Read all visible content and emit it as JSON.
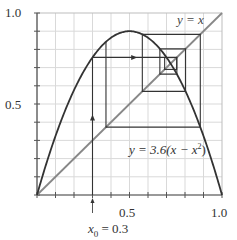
{
  "chart_data": {
    "type": "line",
    "title": "",
    "xlabel": "",
    "ylabel": "",
    "xlim": [
      0,
      1
    ],
    "ylim": [
      0,
      1
    ],
    "grid": true,
    "grid_step": 0.1,
    "x_ticks": [
      "0.5",
      "1.0"
    ],
    "y_ticks": [
      "0.5",
      "1.0"
    ],
    "series": [
      {
        "name": "y = 3.6(x − x²)",
        "kind": "curve",
        "r": 3.6,
        "color": "#333333"
      },
      {
        "name": "y = x",
        "kind": "line",
        "x": [
          0,
          1
        ],
        "y": [
          0,
          1
        ],
        "color": "#888888"
      },
      {
        "name": "cobweb",
        "kind": "iteration",
        "x0": 0.3,
        "color": "#333333",
        "points": [
          [
            0.3,
            0.0
          ],
          [
            0.3,
            0.756
          ],
          [
            0.756,
            0.756
          ],
          [
            0.756,
            0.6641
          ],
          [
            0.6641,
            0.6641
          ],
          [
            0.6641,
            0.8031
          ],
          [
            0.8031,
            0.8031
          ],
          [
            0.8031,
            0.5693
          ],
          [
            0.5693,
            0.5693
          ],
          [
            0.5693,
            0.8827
          ],
          [
            0.8827,
            0.8827
          ],
          [
            0.8827,
            0.3728
          ],
          [
            0.3728,
            0.3728
          ],
          [
            0.3728,
            0.8417
          ]
        ]
      },
      {
        "name": "fixed-point box",
        "kind": "box",
        "x": [
          0.69,
          0.755
        ],
        "y": [
          0.69,
          0.755
        ],
        "color": "#333333"
      }
    ],
    "annotations": [
      {
        "text": "y = x",
        "x": 0.82,
        "y": 0.93
      },
      {
        "text": "y = 3.6(x − x²)",
        "x": 0.62,
        "y": 0.33
      },
      {
        "text": "x₀ = 0.3",
        "x": 0.3,
        "y": -0.12
      }
    ]
  },
  "labels": {
    "y_top": "1.0",
    "y_mid": "0.5",
    "x_mid": "0.5",
    "x_right": "1.0",
    "diag_label": "y = x",
    "curve_label_prefix": "y = 3.6(x − x",
    "curve_label_sup": "2",
    "curve_label_suffix": ")",
    "x0_label_var": "x",
    "x0_label_sub": "0",
    "x0_label_value": " = 0.3"
  }
}
